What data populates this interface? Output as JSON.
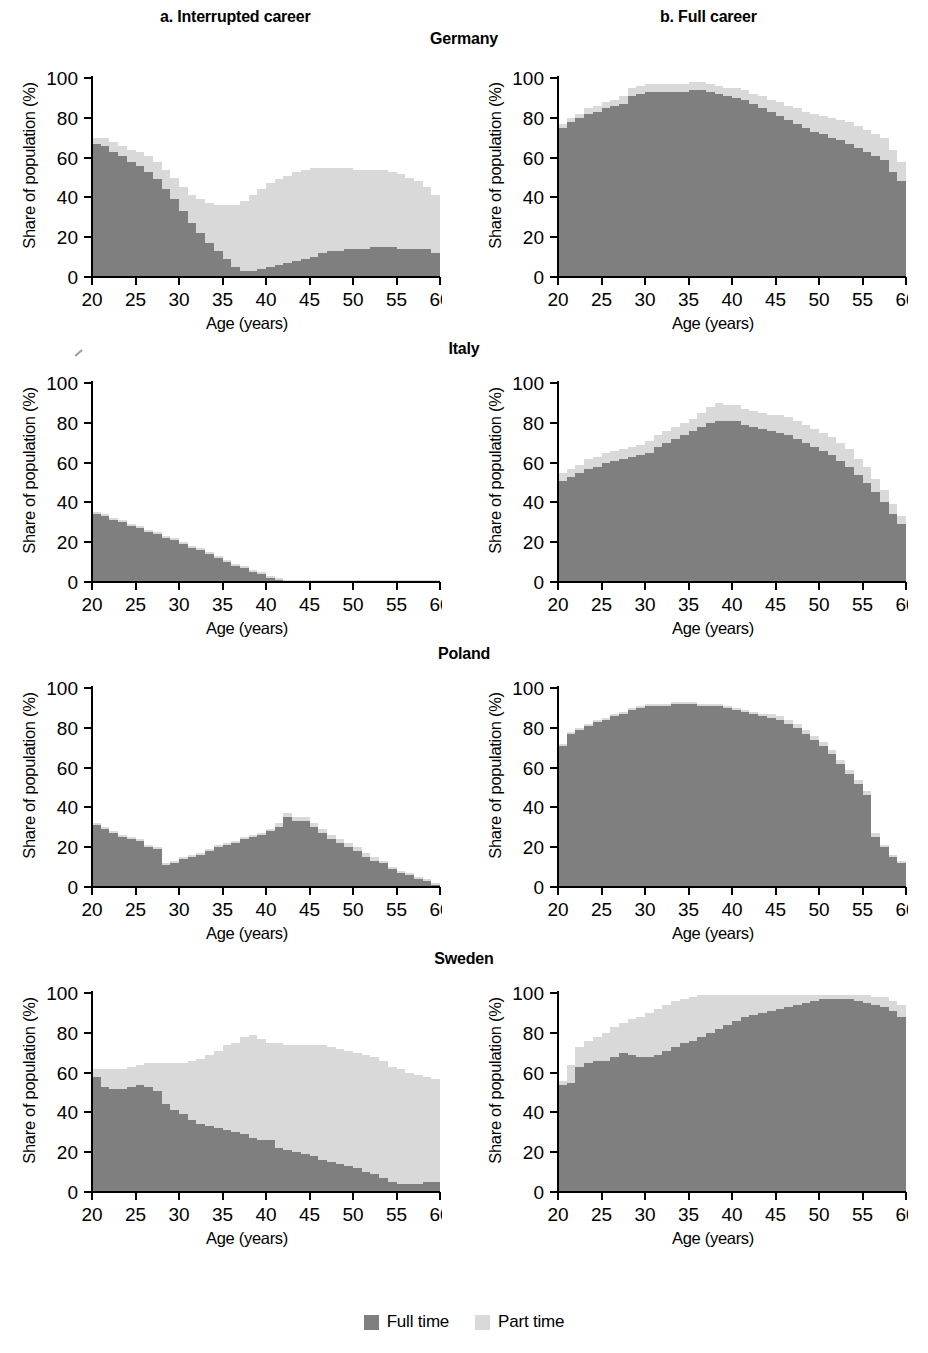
{
  "figure": {
    "column_headers": [
      {
        "key": "a",
        "label": "a. Interrupted career"
      },
      {
        "key": "b",
        "label": "b. Full career"
      }
    ],
    "countries": [
      "Germany",
      "Italy",
      "Poland",
      "Sweden"
    ],
    "legend": {
      "items": [
        {
          "label": "Full time",
          "color": "#7f7f7f"
        },
        {
          "label": "Part time",
          "color": "#d9d9d9"
        }
      ]
    }
  },
  "colors": {
    "full_time": "#7f7f7f",
    "part_time": "#d9d9d9",
    "axis": "#000000",
    "background": "#ffffff"
  },
  "axes": {
    "xlabel": "Age (years)",
    "ylabel": "Share of population (%)",
    "xticks": [
      20,
      25,
      30,
      35,
      40,
      45,
      50,
      55,
      60
    ],
    "yticks": [
      0,
      20,
      40,
      60,
      80,
      100
    ],
    "xlim": [
      20,
      60
    ],
    "ylim": [
      0,
      100
    ],
    "grid": false
  },
  "chart_data": [
    {
      "type": "area",
      "title": "Germany",
      "panel": "a. Interrupted career",
      "xlabel": "Age (years)",
      "ylabel": "Share of population (%)",
      "xlim": [
        20,
        60
      ],
      "ylim": [
        0,
        100
      ],
      "x": [
        20,
        21,
        22,
        23,
        24,
        25,
        26,
        27,
        28,
        29,
        30,
        31,
        32,
        33,
        34,
        35,
        36,
        37,
        38,
        39,
        40,
        41,
        42,
        43,
        44,
        45,
        46,
        47,
        48,
        49,
        50,
        51,
        52,
        53,
        54,
        55,
        56,
        57,
        58,
        59,
        60
      ],
      "series": [
        {
          "name": "Full time",
          "values": [
            67,
            66,
            63,
            61,
            58,
            56,
            53,
            49,
            44,
            39,
            33,
            27,
            22,
            17,
            13,
            9,
            5,
            3,
            3,
            4,
            5,
            6,
            7,
            8,
            9,
            10,
            12,
            13,
            13,
            14,
            14,
            14,
            15,
            15,
            15,
            14,
            14,
            14,
            14,
            12,
            8
          ]
        },
        {
          "name": "Part time",
          "values": [
            3,
            4,
            5,
            5,
            6,
            7,
            8,
            9,
            10,
            11,
            12,
            14,
            17,
            20,
            23,
            27,
            31,
            35,
            38,
            40,
            42,
            43,
            44,
            45,
            45,
            45,
            43,
            42,
            42,
            41,
            40,
            40,
            39,
            39,
            38,
            38,
            36,
            34,
            31,
            29,
            24
          ]
        }
      ]
    },
    {
      "type": "area",
      "title": "Germany",
      "panel": "b. Full career",
      "xlabel": "Age (years)",
      "ylabel": "Share of population (%)",
      "xlim": [
        20,
        60
      ],
      "ylim": [
        0,
        100
      ],
      "x": [
        20,
        21,
        22,
        23,
        24,
        25,
        26,
        27,
        28,
        29,
        30,
        31,
        32,
        33,
        34,
        35,
        36,
        37,
        38,
        39,
        40,
        41,
        42,
        43,
        44,
        45,
        46,
        47,
        48,
        49,
        50,
        51,
        52,
        53,
        54,
        55,
        56,
        57,
        58,
        59,
        60
      ],
      "series": [
        {
          "name": "Full time",
          "values": [
            75,
            78,
            80,
            82,
            83,
            85,
            86,
            87,
            91,
            92,
            93,
            93,
            93,
            93,
            93,
            94,
            94,
            93,
            92,
            91,
            90,
            89,
            87,
            85,
            83,
            81,
            79,
            77,
            75,
            73,
            72,
            70,
            69,
            67,
            65,
            63,
            61,
            59,
            53,
            48,
            41
          ]
        },
        {
          "name": "Part time",
          "values": [
            2,
            2,
            2,
            3,
            3,
            3,
            3,
            4,
            4,
            4,
            4,
            4,
            4,
            4,
            4,
            4,
            4,
            4,
            4,
            4,
            5,
            5,
            5,
            6,
            6,
            7,
            7,
            8,
            8,
            9,
            9,
            10,
            10,
            11,
            11,
            11,
            11,
            11,
            11,
            10,
            10
          ]
        }
      ]
    },
    {
      "type": "area",
      "title": "Italy",
      "panel": "a. Interrupted career",
      "xlabel": "Age (years)",
      "ylabel": "Share of population (%)",
      "xlim": [
        20,
        60
      ],
      "ylim": [
        0,
        100
      ],
      "x": [
        20,
        21,
        22,
        23,
        24,
        25,
        26,
        27,
        28,
        29,
        30,
        31,
        32,
        33,
        34,
        35,
        36,
        37,
        38,
        39,
        40,
        41,
        42,
        43,
        44,
        45,
        46,
        47,
        48,
        49,
        50,
        51,
        52,
        53,
        54,
        55,
        56,
        57,
        58,
        59,
        60
      ],
      "series": [
        {
          "name": "Full time",
          "values": [
            34,
            33,
            31,
            30,
            28,
            27,
            25,
            24,
            22,
            21,
            19,
            17,
            16,
            14,
            12,
            10,
            8,
            7,
            5,
            4,
            2,
            1,
            0,
            0,
            0,
            0,
            0,
            0,
            0,
            0,
            0,
            0,
            0,
            0,
            0,
            0,
            0,
            0,
            0,
            0,
            0
          ]
        },
        {
          "name": "Part time",
          "values": [
            1,
            1,
            1,
            1,
            1,
            1,
            1,
            1,
            1,
            1,
            1,
            1,
            1,
            1,
            1,
            1,
            1,
            1,
            1,
            1,
            1,
            1,
            1,
            1,
            1,
            1,
            1,
            1,
            1,
            1,
            1,
            1,
            1,
            1,
            1,
            1,
            1,
            1,
            1,
            1,
            1
          ]
        }
      ]
    },
    {
      "type": "area",
      "title": "Italy",
      "panel": "b. Full career",
      "xlabel": "Age (years)",
      "ylabel": "Share of population (%)",
      "xlim": [
        20,
        60
      ],
      "ylim": [
        0,
        100
      ],
      "x": [
        20,
        21,
        22,
        23,
        24,
        25,
        26,
        27,
        28,
        29,
        30,
        31,
        32,
        33,
        34,
        35,
        36,
        37,
        38,
        39,
        40,
        41,
        42,
        43,
        44,
        45,
        46,
        47,
        48,
        49,
        50,
        51,
        52,
        53,
        54,
        55,
        56,
        57,
        58,
        59,
        60
      ],
      "series": [
        {
          "name": "Full time",
          "values": [
            51,
            53,
            55,
            57,
            58,
            60,
            61,
            62,
            63,
            64,
            65,
            68,
            70,
            72,
            74,
            76,
            78,
            80,
            81,
            81,
            81,
            79,
            78,
            77,
            76,
            75,
            74,
            72,
            70,
            68,
            66,
            64,
            61,
            58,
            54,
            50,
            45,
            40,
            34,
            29,
            26
          ]
        },
        {
          "name": "Part time",
          "values": [
            4,
            4,
            4,
            5,
            5,
            5,
            5,
            5,
            5,
            5,
            6,
            6,
            6,
            6,
            6,
            6,
            7,
            8,
            9,
            8,
            8,
            8,
            8,
            8,
            8,
            9,
            9,
            9,
            9,
            9,
            9,
            9,
            9,
            9,
            8,
            8,
            7,
            6,
            5,
            4,
            4
          ]
        }
      ]
    },
    {
      "type": "area",
      "title": "Poland",
      "panel": "a. Interrupted career",
      "xlabel": "Age (years)",
      "ylabel": "Share of population (%)",
      "xlim": [
        20,
        60
      ],
      "ylim": [
        0,
        100
      ],
      "x": [
        20,
        21,
        22,
        23,
        24,
        25,
        26,
        27,
        28,
        29,
        30,
        31,
        32,
        33,
        34,
        35,
        36,
        37,
        38,
        39,
        40,
        41,
        42,
        43,
        44,
        45,
        46,
        47,
        48,
        49,
        50,
        51,
        52,
        53,
        54,
        55,
        56,
        57,
        58,
        59,
        60
      ],
      "series": [
        {
          "name": "Full time",
          "values": [
            31,
            29,
            27,
            25,
            24,
            23,
            20,
            19,
            11,
            12,
            14,
            15,
            16,
            18,
            20,
            21,
            22,
            24,
            25,
            26,
            28,
            30,
            35,
            33,
            33,
            30,
            27,
            24,
            22,
            20,
            18,
            15,
            13,
            12,
            9,
            7,
            6,
            4,
            3,
            1,
            0
          ]
        },
        {
          "name": "Part time",
          "values": [
            1,
            1,
            1,
            1,
            1,
            1,
            1,
            1,
            1,
            1,
            1,
            1,
            1,
            1,
            1,
            1,
            1,
            1,
            1,
            1,
            1,
            2,
            2,
            2,
            2,
            2,
            2,
            2,
            2,
            2,
            2,
            2,
            2,
            1,
            1,
            1,
            1,
            1,
            1,
            1,
            0
          ]
        }
      ]
    },
    {
      "type": "area",
      "title": "Poland",
      "panel": "b. Full career",
      "xlabel": "Age (years)",
      "ylabel": "Share of population (%)",
      "xlim": [
        20,
        60
      ],
      "ylim": [
        0,
        100
      ],
      "x": [
        20,
        21,
        22,
        23,
        24,
        25,
        26,
        27,
        28,
        29,
        30,
        31,
        32,
        33,
        34,
        35,
        36,
        37,
        38,
        39,
        40,
        41,
        42,
        43,
        44,
        45,
        46,
        47,
        48,
        49,
        50,
        51,
        52,
        53,
        54,
        55,
        56,
        57,
        58,
        59,
        60
      ],
      "series": [
        {
          "name": "Full time",
          "values": [
            71,
            77,
            79,
            81,
            83,
            84,
            86,
            87,
            89,
            90,
            91,
            91,
            91,
            92,
            92,
            92,
            91,
            91,
            91,
            90,
            89,
            88,
            87,
            86,
            85,
            84,
            82,
            80,
            77,
            74,
            71,
            67,
            62,
            57,
            52,
            46,
            25,
            20,
            15,
            12,
            9
          ]
        },
        {
          "name": "Part time",
          "values": [
            1,
            1,
            1,
            1,
            1,
            1,
            1,
            1,
            1,
            1,
            1,
            1,
            1,
            1,
            1,
            1,
            1,
            1,
            1,
            1,
            1,
            1,
            1,
            1,
            2,
            2,
            2,
            2,
            2,
            2,
            2,
            2,
            2,
            2,
            2,
            2,
            2,
            1,
            1,
            1,
            1
          ]
        }
      ]
    },
    {
      "type": "area",
      "title": "Sweden",
      "panel": "a. Interrupted career",
      "xlabel": "Age (years)",
      "ylabel": "Share of population (%)",
      "xlim": [
        20,
        60
      ],
      "ylim": [
        0,
        100
      ],
      "x": [
        20,
        21,
        22,
        23,
        24,
        25,
        26,
        27,
        28,
        29,
        30,
        31,
        32,
        33,
        34,
        35,
        36,
        37,
        38,
        39,
        40,
        41,
        42,
        43,
        44,
        45,
        46,
        47,
        48,
        49,
        50,
        51,
        52,
        53,
        54,
        55,
        56,
        57,
        58,
        59,
        60
      ],
      "series": [
        {
          "name": "Full time",
          "values": [
            58,
            53,
            52,
            52,
            53,
            54,
            53,
            51,
            44,
            41,
            39,
            36,
            34,
            33,
            32,
            31,
            30,
            29,
            27,
            26,
            26,
            22,
            21,
            20,
            19,
            18,
            16,
            15,
            14,
            13,
            12,
            10,
            9,
            7,
            5,
            4,
            4,
            4,
            5,
            5,
            5
          ]
        },
        {
          "name": "Part time",
          "values": [
            4,
            9,
            10,
            10,
            10,
            10,
            12,
            14,
            21,
            24,
            26,
            30,
            33,
            36,
            39,
            43,
            45,
            49,
            52,
            51,
            49,
            53,
            53,
            54,
            55,
            56,
            58,
            58,
            58,
            58,
            58,
            59,
            59,
            59,
            58,
            58,
            56,
            55,
            53,
            52,
            52
          ]
        }
      ]
    },
    {
      "type": "area",
      "title": "Sweden",
      "panel": "b. Full career",
      "xlabel": "Age (years)",
      "ylabel": "Share of population (%)",
      "xlim": [
        20,
        60
      ],
      "ylim": [
        0,
        100
      ],
      "x": [
        20,
        21,
        22,
        23,
        24,
        25,
        26,
        27,
        28,
        29,
        30,
        31,
        32,
        33,
        34,
        35,
        36,
        37,
        38,
        39,
        40,
        41,
        42,
        43,
        44,
        45,
        46,
        47,
        48,
        49,
        50,
        51,
        52,
        53,
        54,
        55,
        56,
        57,
        58,
        59,
        60
      ],
      "series": [
        {
          "name": "Full time",
          "values": [
            54,
            55,
            63,
            65,
            66,
            66,
            68,
            70,
            69,
            68,
            68,
            69,
            71,
            73,
            75,
            76,
            78,
            80,
            82,
            84,
            86,
            88,
            89,
            90,
            91,
            92,
            93,
            94,
            95,
            96,
            97,
            97,
            97,
            97,
            96,
            95,
            94,
            93,
            91,
            88,
            84
          ]
        },
        {
          "name": "Part time",
          "values": [
            2,
            9,
            10,
            11,
            12,
            14,
            15,
            15,
            18,
            20,
            22,
            23,
            23,
            23,
            22,
            22,
            21,
            19,
            17,
            15,
            13,
            11,
            10,
            9,
            8,
            7,
            6,
            5,
            4,
            3,
            2,
            2,
            2,
            2,
            3,
            4,
            4,
            5,
            5,
            6,
            6
          ]
        }
      ]
    }
  ]
}
